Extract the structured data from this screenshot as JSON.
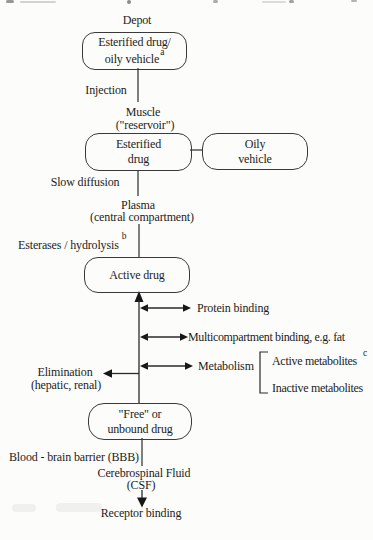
{
  "labels": {
    "depot": "Depot",
    "injection": "Injection",
    "muscle": "Muscle",
    "reservoir": "(\"reservoir\")",
    "slow_diffusion": "Slow diffusion",
    "plasma": "Plasma",
    "central_compartment": "(central compartment)",
    "esterases": "Esterases / hydrolysis",
    "esterases_sup": "b",
    "protein_binding": "Protein binding",
    "multicompartment": "Multicompartment binding, e.g. fat",
    "metabolism": "Metabolism",
    "active_metabolites": "Active metabolites",
    "active_metabolites_sup": "c",
    "inactive_metabolites": "Inactive metabolites",
    "elimination": "Elimination",
    "elimination_detail": "(hepatic, renal)",
    "blood_brain_barrier": "Blood - brain barrier (BBB)",
    "csf": "Cerebrospinal Fluid",
    "csf_abbr": "(CSF)",
    "receptor_binding": "Receptor binding"
  },
  "boxes": {
    "depot_box": {
      "line1": "Esterified drug/",
      "line2": "oily vehicle",
      "sup": "a"
    },
    "muscle_box": {
      "line1": "Esterified",
      "line2": "drug"
    },
    "vehicle_box": {
      "line1": "Oily",
      "line2": "vehicle"
    },
    "active_box": {
      "line1": "Active drug"
    },
    "free_box": {
      "line1": "\"Free\" or",
      "line2": "unbound drug"
    }
  },
  "colors": {
    "ink": "#1c1c1c",
    "line": "#2a2a2a",
    "paper": "#fcfcfa"
  }
}
